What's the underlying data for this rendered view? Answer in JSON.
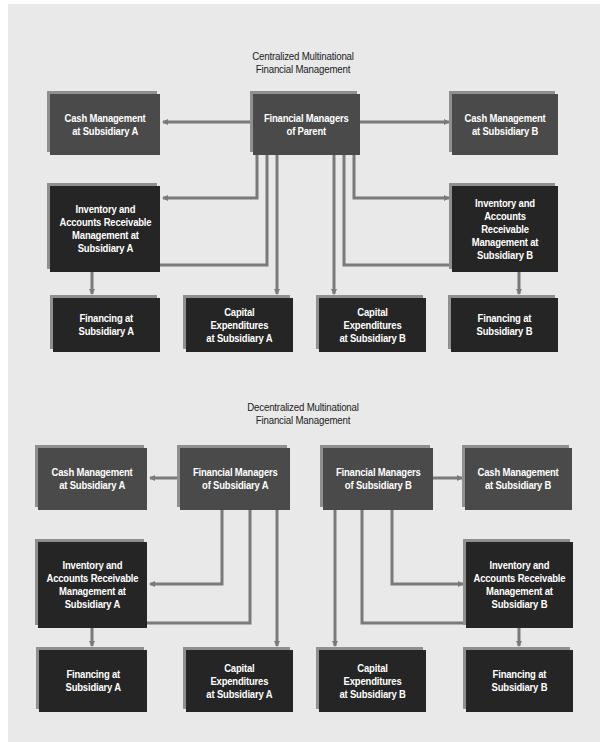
{
  "colors": {
    "background_panel": "#e9e9e9",
    "manager_box": "#4a4a4a",
    "function_box": "#252525",
    "connector": "#7a7a7a",
    "box_shadow": "#8f8f8f"
  },
  "centralized": {
    "title": "Centralized Multinational\nFinancial Management",
    "nodes": {
      "parent": "Financial Managers\nof Parent",
      "cash_a": "Cash Management\nat Subsidiary A",
      "cash_b": "Cash Management\nat Subsidiary B",
      "inventory_a": "Inventory and\nAccounts Receivable\nManagement at\nSubsidiary A",
      "inventory_b": "Inventory and\nAccounts Receivable\nManagement at\nSubsidiary B",
      "financing_a": "Financing at\nSubsidiary A",
      "capex_a": "Capital\nExpenditures\nat Subsidiary A",
      "capex_b": "Capital\nExpenditures\nat Subsidiary B",
      "financing_b": "Financing at\nSubsidiary B"
    },
    "edges": [
      [
        "parent",
        "cash_a"
      ],
      [
        "parent",
        "cash_b"
      ],
      [
        "parent",
        "inventory_a"
      ],
      [
        "parent",
        "inventory_b"
      ],
      [
        "parent",
        "financing_a"
      ],
      [
        "parent",
        "capex_a"
      ],
      [
        "parent",
        "capex_b"
      ],
      [
        "parent",
        "financing_b"
      ]
    ]
  },
  "decentralized": {
    "title": "Decentralized Multinational\nFinancial Management",
    "nodes": {
      "managers_a": "Financial Managers\nof Subsidiary A",
      "managers_b": "Financial Managers\nof Subsidiary B",
      "cash_a": "Cash Management\nat Subsidiary A",
      "cash_b": "Cash Management\nat Subsidiary B",
      "inventory_a": "Inventory and\nAccounts Receivable\nManagement at\nSubsidiary A",
      "inventory_b": "Inventory and\nAccounts Receivable\nManagement at\nSubsidiary B",
      "financing_a": "Financing at\nSubsidiary A",
      "capex_a": "Capital\nExpenditures\nat Subsidiary A",
      "capex_b": "Capital\nExpenditures\nat Subsidiary B",
      "financing_b": "Financing at\nSubsidiary B"
    },
    "edges": [
      [
        "managers_a",
        "cash_a"
      ],
      [
        "managers_a",
        "inventory_a"
      ],
      [
        "managers_a",
        "financing_a"
      ],
      [
        "managers_a",
        "capex_a"
      ],
      [
        "managers_b",
        "cash_b"
      ],
      [
        "managers_b",
        "inventory_b"
      ],
      [
        "managers_b",
        "financing_b"
      ],
      [
        "managers_b",
        "capex_b"
      ]
    ]
  }
}
